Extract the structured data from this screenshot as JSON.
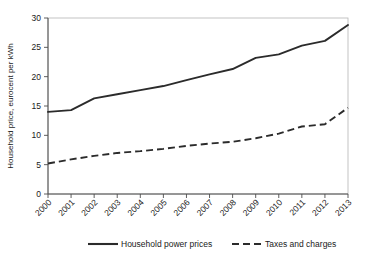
{
  "chart_data": {
    "type": "line",
    "title": "",
    "xlabel": "",
    "ylabel": "Household price, eurocent per kWh",
    "categories": [
      "2000",
      "2001",
      "2002",
      "2003",
      "2004",
      "2005",
      "2006",
      "2007",
      "2008",
      "2009",
      "2010",
      "2011",
      "2012",
      "2013"
    ],
    "ylim": [
      0,
      30
    ],
    "yticks": [
      0,
      5,
      10,
      15,
      20,
      25,
      30
    ],
    "grid": false,
    "legend_position": "bottom-center",
    "series": [
      {
        "name": "Household power prices",
        "style": "solid",
        "color": "#2b2b2b",
        "values": [
          14.0,
          14.3,
          16.3,
          17.0,
          17.7,
          18.4,
          19.4,
          20.4,
          21.3,
          23.2,
          23.8,
          25.3,
          26.1,
          28.8
        ]
      },
      {
        "name": "Taxes and charges",
        "style": "dashed",
        "color": "#2b2b2b",
        "values": [
          5.2,
          5.9,
          6.5,
          7.0,
          7.3,
          7.7,
          8.2,
          8.6,
          8.9,
          9.5,
          10.3,
          11.5,
          11.9,
          14.7
        ]
      }
    ]
  },
  "axis": {
    "y_title": "Household price, eurocent per kWh",
    "y_tick_labels": [
      "0",
      "5",
      "10",
      "15",
      "20",
      "25",
      "30"
    ],
    "x_tick_labels": [
      "2000",
      "2001",
      "2002",
      "2003",
      "2004",
      "2005",
      "2006",
      "2007",
      "2008",
      "2009",
      "2010",
      "2011",
      "2012",
      "2013"
    ]
  },
  "legend": {
    "items": [
      {
        "label": "Household power prices",
        "style": "solid"
      },
      {
        "label": "Taxes and charges",
        "style": "dashed"
      }
    ]
  },
  "colors": {
    "series": "#2b2b2b",
    "axis": "#4d4d4d",
    "frame": "#b5b5b5",
    "background": "#ffffff"
  }
}
